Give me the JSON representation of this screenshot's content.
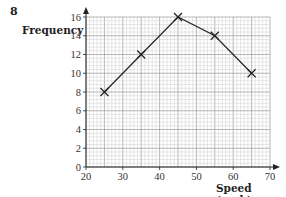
{
  "question_number": "8",
  "chart_data": {
    "type": "line",
    "title": "",
    "xlabel": "Speed (mph)",
    "ylabel": "Frequency",
    "x": [
      25,
      35,
      45,
      55,
      65
    ],
    "series": [
      {
        "name": "Frequency",
        "values": [
          8,
          12,
          16,
          14,
          10
        ],
        "marker": "x"
      }
    ],
    "xlim": [
      20,
      70
    ],
    "ylim": [
      0,
      16
    ],
    "xticks": [
      20,
      30,
      40,
      50,
      60,
      70
    ],
    "yticks": [
      0,
      2,
      4,
      6,
      8,
      10,
      12,
      14,
      16
    ],
    "grid": true,
    "legend": null
  }
}
